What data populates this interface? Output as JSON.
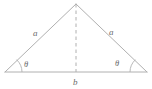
{
  "figure": {
    "type": "geometry-diagram",
    "shape_name": "isosceles-triangle",
    "background_color": "#ffffff",
    "line_color": "#b0b0b0",
    "text_color": "#6b6b6b"
  },
  "labels": {
    "side_left": "a",
    "side_right": "a",
    "base": "b",
    "angle_left": "θ",
    "angle_right": "θ"
  },
  "geometry": {
    "apex": {
      "x": 76,
      "y": 4
    },
    "base_left": {
      "x": 5,
      "y": 72
    },
    "base_right": {
      "x": 147,
      "y": 72
    },
    "base_midpoint": {
      "x": 76,
      "y": 72
    },
    "altitude_style": "dashed",
    "angle_arc_radius": 17
  }
}
